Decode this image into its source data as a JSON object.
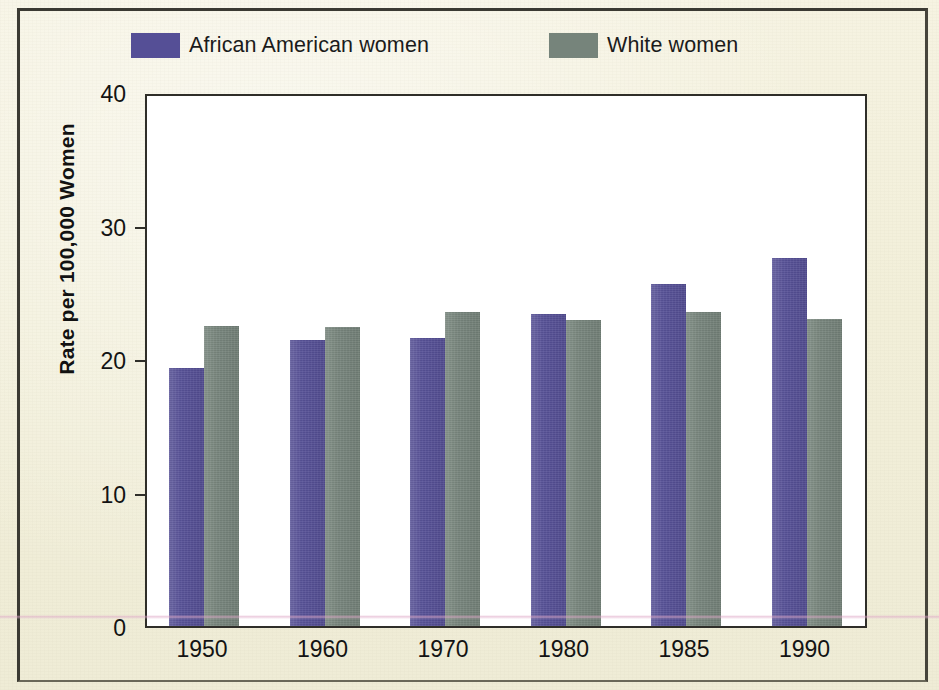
{
  "figure": {
    "background_color": "#f2efd9",
    "plot_background_color": "#ffffff",
    "frame_color": "#2f2e29"
  },
  "legend": {
    "position": "top-left",
    "items": [
      {
        "label": "African American women",
        "color": "#554f96",
        "swatch_name": "legend-swatch-african-american-women"
      },
      {
        "label": "White women",
        "color": "#76847b",
        "swatch_name": "legend-swatch-white-women"
      }
    ]
  },
  "axes": {
    "y_title": "Rate per 100,000 Women",
    "y_ticks": [
      "40",
      "30",
      "20",
      "10",
      "0"
    ],
    "x_ticks": [
      "1950",
      "1960",
      "1970",
      "1980",
      "1985",
      "1990"
    ]
  },
  "chart_data": {
    "type": "bar",
    "title": "",
    "subtitle": "",
    "xlabel": "",
    "ylabel": "Rate per 100,000 Women",
    "categories": [
      "1950",
      "1960",
      "1970",
      "1980",
      "1985",
      "1990"
    ],
    "series": [
      {
        "name": "African American women",
        "color": "#554f96",
        "values": [
          19.3,
          21.4,
          21.6,
          23.4,
          25.6,
          27.6
        ]
      },
      {
        "name": "White women",
        "color": "#76847b",
        "values": [
          22.5,
          22.4,
          23.5,
          22.9,
          23.5,
          23.0
        ]
      }
    ],
    "ylim": [
      0,
      40
    ],
    "ytick_values": [
      0,
      10,
      20,
      30,
      40
    ],
    "grid": false,
    "legend_position": "top-left",
    "bar_group_layout": "grouped",
    "annotations": []
  }
}
